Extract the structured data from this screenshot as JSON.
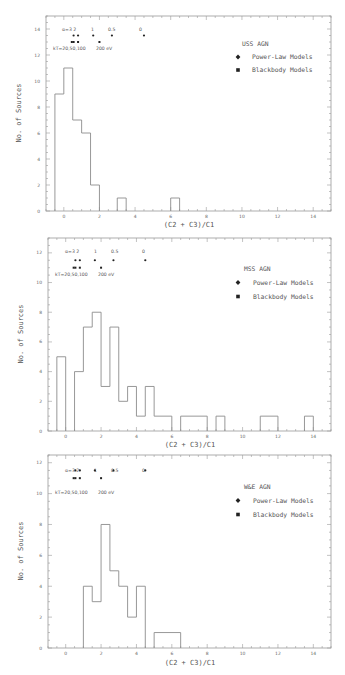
{
  "chart_data": [
    {
      "type": "bar",
      "subtype": "step-histogram",
      "title": "USS AGN",
      "xlabel": "(C2 + C3)/C1",
      "ylabel": "No. of Sources",
      "xlim": [
        -1,
        15
      ],
      "ylim": [
        0,
        15
      ],
      "xticks": [
        0,
        2,
        4,
        6,
        8,
        10,
        12,
        14
      ],
      "yticks": [
        0,
        2,
        4,
        6,
        8,
        10,
        12,
        14
      ],
      "grid": false,
      "legend_position": "upper right",
      "legend": [
        "USS AGN",
        "Power-Law Models",
        "Blackbody Models"
      ],
      "bins": [
        {
          "x0": -0.5,
          "x1": 0.0,
          "count": 9
        },
        {
          "x0": 0.0,
          "x1": 0.5,
          "count": 11
        },
        {
          "x0": 0.5,
          "x1": 1.0,
          "count": 7
        },
        {
          "x0": 1.0,
          "x1": 1.5,
          "count": 6
        },
        {
          "x0": 1.5,
          "x1": 2.0,
          "count": 2
        },
        {
          "x0": 3.0,
          "x1": 3.5,
          "count": 1
        },
        {
          "x0": 6.0,
          "x1": 6.5,
          "count": 1
        }
      ],
      "model_markers": {
        "power_law": {
          "label": "α=3 2 1 0.5 0",
          "x": [
            0.55,
            0.8,
            1.65,
            2.7,
            4.5
          ],
          "y": 13.5,
          "alpha_labels": [
            "α=3",
            "2",
            "1",
            "0.5",
            "0"
          ]
        },
        "blackbody": {
          "label": "kT=20,50,100 200 eV",
          "x": [
            0.45,
            0.55,
            0.8,
            2.0
          ],
          "y": 13.0
        }
      }
    },
    {
      "type": "bar",
      "subtype": "step-histogram",
      "title": "MSS AGN",
      "xlabel": "(C2 + C3)/C1",
      "ylabel": "No. of Sources",
      "xlim": [
        -1,
        15
      ],
      "ylim": [
        0,
        13
      ],
      "xticks": [
        0,
        2,
        4,
        6,
        8,
        10,
        12,
        14
      ],
      "yticks": [
        0,
        2,
        4,
        6,
        8,
        10,
        12
      ],
      "grid": false,
      "legend_position": "upper right",
      "legend": [
        "MSS AGN",
        "Power-Law Models",
        "Blackbody Models"
      ],
      "bins": [
        {
          "x0": -0.5,
          "x1": 0.0,
          "count": 5
        },
        {
          "x0": 0.5,
          "x1": 1.0,
          "count": 4
        },
        {
          "x0": 1.0,
          "x1": 1.5,
          "count": 7
        },
        {
          "x0": 1.5,
          "x1": 2.0,
          "count": 8
        },
        {
          "x0": 2.0,
          "x1": 2.5,
          "count": 3
        },
        {
          "x0": 2.5,
          "x1": 3.0,
          "count": 7
        },
        {
          "x0": 3.0,
          "x1": 3.5,
          "count": 2
        },
        {
          "x0": 3.5,
          "x1": 4.0,
          "count": 3
        },
        {
          "x0": 4.0,
          "x1": 4.5,
          "count": 1
        },
        {
          "x0": 4.5,
          "x1": 5.0,
          "count": 3
        },
        {
          "x0": 5.0,
          "x1": 6.0,
          "count": 1
        },
        {
          "x0": 6.5,
          "x1": 8.0,
          "count": 1
        },
        {
          "x0": 8.5,
          "x1": 9.0,
          "count": 1
        },
        {
          "x0": 11.0,
          "x1": 12.0,
          "count": 1
        },
        {
          "x0": 13.5,
          "x1": 14.0,
          "count": 1
        }
      ],
      "model_markers": {
        "power_law": {
          "x": [
            0.55,
            0.8,
            1.65,
            2.7,
            4.5
          ],
          "y": 11.5,
          "alpha_labels": [
            "α=3",
            "2",
            "1",
            "0.5",
            "0"
          ]
        },
        "blackbody": {
          "x": [
            0.45,
            0.55,
            0.8,
            2.0
          ],
          "y": 11.0
        }
      }
    },
    {
      "type": "bar",
      "subtype": "step-histogram",
      "title": "W&E AGN",
      "xlabel": "(C2 + C3)/C1",
      "ylabel": "No. of Sources",
      "xlim": [
        -1,
        15
      ],
      "ylim": [
        0,
        12.5
      ],
      "xticks": [
        0,
        2,
        4,
        6,
        8,
        10,
        12,
        14
      ],
      "yticks": [
        0,
        2,
        4,
        6,
        8,
        10,
        12
      ],
      "grid": false,
      "legend_position": "upper right",
      "legend": [
        "W&E AGN",
        "Power-Law Models",
        "Blackbody Models"
      ],
      "bins": [
        {
          "x0": 1.0,
          "x1": 1.5,
          "count": 4
        },
        {
          "x0": 1.5,
          "x1": 2.0,
          "count": 3
        },
        {
          "x0": 2.0,
          "x1": 2.5,
          "count": 8
        },
        {
          "x0": 2.5,
          "x1": 3.0,
          "count": 5
        },
        {
          "x0": 3.0,
          "x1": 3.5,
          "count": 4
        },
        {
          "x0": 3.5,
          "x1": 4.0,
          "count": 2
        },
        {
          "x0": 4.0,
          "x1": 4.5,
          "count": 4
        },
        {
          "x0": 5.0,
          "x1": 6.5,
          "count": 1
        }
      ],
      "model_markers": {
        "power_law": {
          "x": [
            0.55,
            0.8,
            1.65,
            2.7,
            4.5
          ],
          "y": 11.5,
          "alpha_labels": [
            "α=3",
            "2",
            "1",
            "0.5",
            "0"
          ]
        },
        "blackbody": {
          "x": [
            0.45,
            0.55,
            0.8,
            2.0
          ],
          "y": 11.0
        }
      }
    }
  ],
  "panels": [
    {
      "title": "USS AGN",
      "xlabel": "(C2 + C3)/C1",
      "ylabel": "No. of Sources",
      "legend_power": "Power-Law Models",
      "legend_bb": "Blackbody Models",
      "alpha_text": "α=3 2",
      "alpha_1": "1",
      "alpha_05": "0.5",
      "alpha_0": "0",
      "kt_text": "kT=20,50,100",
      "kt_200": "200  eV"
    },
    {
      "title": "MSS AGN",
      "xlabel": "(C2 + C3)/C1",
      "ylabel": "No. of Sources",
      "legend_power": "Power-Law Models",
      "legend_bb": "Blackbody Models",
      "alpha_text": "α=3 2",
      "alpha_1": "1",
      "alpha_05": "0.5",
      "alpha_0": "0",
      "kt_text": "kT=20,50,100",
      "kt_200": "200  eV"
    },
    {
      "title": "W&E AGN",
      "xlabel": "(C2 + C3)/C1",
      "ylabel": "No. of Sources",
      "legend_power": "Power-Law Models",
      "legend_bb": "Blackbody Models",
      "alpha_text": "α=3 2",
      "alpha_1": "1",
      "alpha_05": "0.5",
      "alpha_0": "0",
      "kt_text": "kT=20,50,100",
      "kt_200": "200  eV"
    }
  ],
  "layout": {
    "frames": [
      {
        "x": 46,
        "y": 16,
        "w": 285,
        "h": 195
      },
      {
        "x": 48,
        "y": 238,
        "w": 283,
        "h": 193
      },
      {
        "x": 48,
        "y": 455,
        "w": 283,
        "h": 193
      }
    ],
    "colors": {
      "frame": "#9a9a9a",
      "histogram": "#8c8c8c",
      "text": "#555555"
    }
  }
}
